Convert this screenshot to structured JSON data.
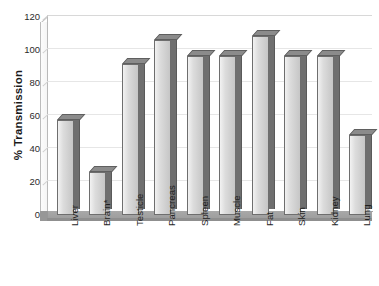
{
  "chart_data": {
    "type": "bar",
    "title": "",
    "subtitle": "",
    "xlabel": "",
    "ylabel": "% Transmission",
    "ylim": [
      0,
      120
    ],
    "ytick_step": 20,
    "yticks": [
      "0",
      "20",
      "40",
      "60",
      "80",
      "100",
      "120"
    ],
    "grid": true,
    "legend": null,
    "style": "3d-column",
    "categories": [
      "Liver",
      "Brain*",
      "Testicle",
      "Pancreas",
      "Spleen",
      "Muscle",
      "Fat",
      "Skin",
      "Kidney",
      "Lung"
    ],
    "values": [
      61,
      30,
      95,
      110,
      100,
      100,
      112,
      100,
      100,
      52
    ],
    "annotations": [
      "* asterisk on Brain category label"
    ],
    "colors": {
      "bar_face": "#d8d8d8",
      "bar_side": "#6f6f6f",
      "bar_top": "#8b8b8b",
      "bar_outline": "#6e6e6e",
      "floor": "#a0a0a0",
      "gridline": "#e6e6e6",
      "text": "#1f1f1f",
      "background": "#ffffff"
    }
  }
}
